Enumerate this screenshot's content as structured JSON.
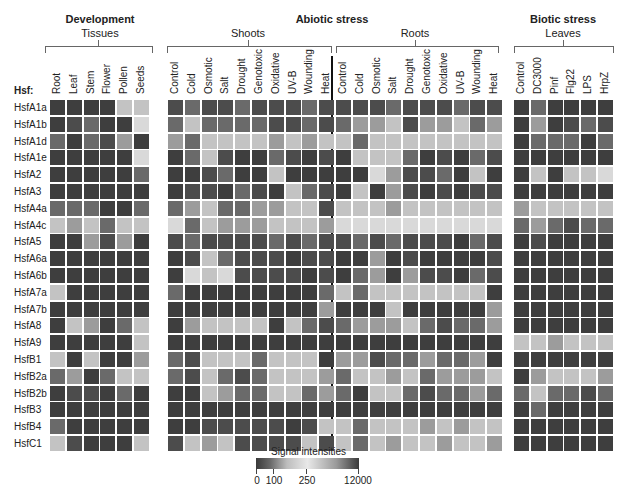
{
  "chart_data": {
    "type": "heatmap",
    "title": "",
    "row_header": "Hsf:",
    "rows": [
      "HsfA1a",
      "HsfA1b",
      "HsfA1d",
      "HsfA1e",
      "HsfA2",
      "HsfA3",
      "HsfA4a",
      "HsfA4c",
      "HsfA5",
      "HsfA6a",
      "HsfA6b",
      "HsfA7a",
      "HsfA7b",
      "HsfA8",
      "HsfA9",
      "HsfB1",
      "HsfB2a",
      "HsfB2b",
      "HsfB3",
      "HsfB4",
      "HsfC1"
    ],
    "groups": [
      {
        "title": "Development",
        "subgroups": [
          {
            "title": "Tissues",
            "columns": [
              "Root",
              "Leaf",
              "Stem",
              "Flower",
              "Pollen",
              "Seeds"
            ]
          }
        ]
      },
      {
        "title": "Abiotic stress",
        "subgroups": [
          {
            "title": "Shoots",
            "columns": [
              "Control",
              "Cold",
              "Osmotic",
              "Salt",
              "Drought",
              "Genotoxic",
              "Oxidative",
              "UV-B",
              "Wounding",
              "Heat"
            ]
          },
          {
            "title": "Roots",
            "columns": [
              "Control",
              "Cold",
              "Osmotic",
              "Salt",
              "Drought",
              "Genotoxic",
              "Oxidative",
              "UV-B",
              "Wounding",
              "Heat"
            ]
          }
        ]
      },
      {
        "title": "Biotic stress",
        "subgroups": [
          {
            "title": "Leaves",
            "columns": [
              "Control",
              "DC3000",
              "Pinf",
              "Flg22",
              "LPS",
              "HrpZ"
            ]
          }
        ]
      }
    ],
    "legend": {
      "title": "Signal intensities",
      "ticks": [
        "0",
        "100",
        "250",
        "12000"
      ]
    },
    "shade_key": {
      "D": "#3e3e3e",
      "d": "#4c4c4c",
      "m": "#6a6a6a",
      "l": "#9c9c9c",
      "L": "#c3c3c3",
      "W": "#d9d9d9"
    },
    "cells": {
      "Tissues": [
        "DDDDLL",
        "DdmDDW",
        "mDmdlD",
        "DDDDDW",
        "DDDDDm",
        "DDDDDD",
        "mmmDDm",
        "LlLmLL",
        "DDldlD",
        "DDDDDD",
        "DDDDDD",
        "LDDDDD",
        "DDDDDD",
        "DLlDmL",
        "DDDDDL",
        "LDLDDl",
        "mlDmLL",
        "DddDmD",
        "DDDDDD",
        "mDDDDD",
        "LdDDDL"
      ],
      "Shoots": [
        "dmddmdddmd",
        "mLmmmmddmd",
        "lmLLLLlLlL",
        "DmLdDDmdDd",
        "DDdmDDLDDD",
        "DddDmdDLmd",
        "mlLmmllLLd",
        "WmLlllLLLl",
        "dmddddmdmd",
        "DdLmdddDdd",
        "DWLWddddDd",
        "mDDDDDDDDm",
        "DDDDDDDDDl",
        "DlLLLLDLmd",
        "DDDDDDDDDD",
        "mdLLLmLLLD",
        "mdLmdmLLLl",
        "DDLlmmLLml",
        "DDDDDDDDDD",
        "DDdddddDdL",
        "dLlLddddLd"
      ],
      "Roots": [
        "dddmdddmdd",
        "mllLdllLml",
        "LmLLLLLLLL",
        "DLLLmDdDmd",
        "DDWlddmDLD",
        "DLDldDdDdd",
        "LLLlLLLLLL",
        "WWWWWWWWWW",
        "dmdmdddDmd",
        "DDlDdDDDDd",
        "DmlDlddDmd",
        "LmLLLLLLLD",
        "DDDLDDDDDl",
        "mlllLmdmml",
        "DDDDDDDDDD",
        "lldmmlmmlD",
        "mLLlLmlllL",
        "mDLLmdmmlm",
        "DDDDDDDDDD",
        "LmLLLlLlLL",
        "LmLlLLlLLl"
      ],
      "Leaves": [
        "DmDDDD",
        "DlDdmd",
        "DmmmDm",
        "DDDDDD",
        "DLDLLW",
        "DDDDDD",
        "lLLLLL",
        "mlmdmm",
        "DdDDDD",
        "DDDDDD",
        "DDDDDD",
        "DDDDDD",
        "DDDDDD",
        "DDDDDD",
        "LLlLLL",
        "DDDDDD",
        "DlLLLl",
        "mLmmdm",
        "DmDDDD",
        "DDDDDD",
        "DDDDDD"
      ]
    }
  },
  "labels": {
    "development": "Development",
    "tissues": "Tissues",
    "abiotic": "Abiotic stress",
    "shoots": "Shoots",
    "roots": "Roots",
    "biotic": "Biotic stress",
    "leaves": "Leaves",
    "hsf": "Hsf:",
    "legend_title": "Signal intensities",
    "legend_ticks": [
      "0",
      "100",
      "250",
      "12000"
    ]
  }
}
